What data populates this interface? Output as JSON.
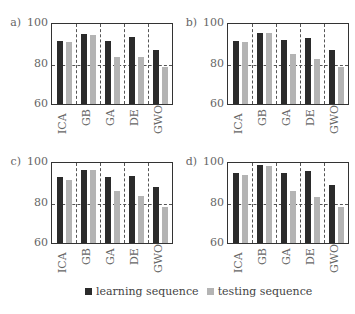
{
  "chart_data": [
    {
      "type": "bar",
      "title": "a)",
      "categories": [
        "ICA",
        "GB",
        "GA",
        "DE",
        "GWO"
      ],
      "series": [
        {
          "name": "learning sequence",
          "values": [
            91,
            94.5,
            91,
            93,
            86.5
          ]
        },
        {
          "name": "testing sequence",
          "values": [
            90.5,
            94,
            83,
            83,
            78.5
          ]
        }
      ],
      "xlabel": "",
      "ylabel": "",
      "ylim": [
        60,
        100
      ],
      "yticks": [
        60,
        80,
        100
      ],
      "grid": {
        "horizontal_dashed_at": [
          80
        ],
        "vertical_dashed_separators": true
      }
    },
    {
      "type": "bar",
      "title": "b)",
      "categories": [
        "ICA",
        "GB",
        "GA",
        "DE",
        "GWO"
      ],
      "series": [
        {
          "name": "learning sequence",
          "values": [
            91,
            95,
            91.5,
            92.5,
            86.5
          ]
        },
        {
          "name": "testing sequence",
          "values": [
            90.5,
            95,
            84.5,
            82,
            78.5
          ]
        }
      ],
      "xlabel": "",
      "ylabel": "",
      "ylim": [
        60,
        100
      ],
      "yticks": [
        60,
        80,
        100
      ],
      "grid": {
        "horizontal_dashed_at": [
          80
        ],
        "vertical_dashed_separators": true
      }
    },
    {
      "type": "bar",
      "title": "c)",
      "categories": [
        "ICA",
        "GB",
        "GA",
        "DE",
        "GWO"
      ],
      "series": [
        {
          "name": "learning sequence",
          "values": [
            92.5,
            96,
            92.5,
            93,
            87.5
          ]
        },
        {
          "name": "testing sequence",
          "values": [
            91,
            96,
            85.5,
            83,
            78
          ]
        }
      ],
      "xlabel": "",
      "ylabel": "",
      "ylim": [
        60,
        100
      ],
      "yticks": [
        60,
        80,
        100
      ],
      "grid": {
        "horizontal_dashed_at": [
          80
        ],
        "vertical_dashed_separators": true
      }
    },
    {
      "type": "bar",
      "title": "d)",
      "categories": [
        "ICA",
        "GB",
        "GA",
        "DE",
        "GWO"
      ],
      "series": [
        {
          "name": "learning sequence",
          "values": [
            94.5,
            98.5,
            94.5,
            95.5,
            88.5
          ]
        },
        {
          "name": "testing sequence",
          "values": [
            93.5,
            98,
            85.5,
            82.5,
            78
          ]
        }
      ],
      "xlabel": "",
      "ylabel": "",
      "ylim": [
        60,
        100
      ],
      "yticks": [
        60,
        80,
        100
      ],
      "grid": {
        "horizontal_dashed_at": [
          80
        ],
        "vertical_dashed_separators": true
      }
    }
  ],
  "legend": {
    "position": "bottom-center",
    "items": [
      {
        "label": "learning sequence",
        "color": "#2b2b2b"
      },
      {
        "label": "testing sequence",
        "color": "#b4b4b4"
      }
    ]
  },
  "colors": {
    "learning": "#2b2b2b",
    "testing": "#b4b4b4"
  }
}
